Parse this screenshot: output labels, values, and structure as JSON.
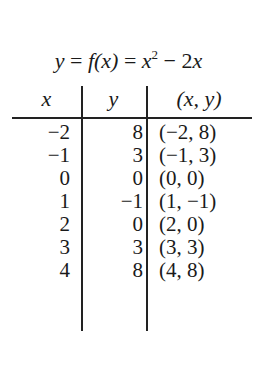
{
  "title": {
    "lhs": "y",
    "eq1": "=",
    "fx": "f(x)",
    "eq2": "=",
    "x": "x",
    "exp": "2",
    "minus": "−",
    "term": "2x"
  },
  "table": {
    "headers": [
      "x",
      "y",
      "(x, y)"
    ],
    "rows": [
      {
        "x": "−2",
        "y": "8",
        "pair": "(−2, 8)"
      },
      {
        "x": "−1",
        "y": "3",
        "pair": "(−1, 3)"
      },
      {
        "x": "0",
        "y": "0",
        "pair": "(0, 0)"
      },
      {
        "x": "1",
        "y": "−1",
        "pair": "(1, −1)"
      },
      {
        "x": "2",
        "y": "0",
        "pair": "(2, 0)"
      },
      {
        "x": "3",
        "y": "3",
        "pair": "(3, 3)"
      },
      {
        "x": "4",
        "y": "8",
        "pair": "(4, 8)"
      }
    ]
  }
}
